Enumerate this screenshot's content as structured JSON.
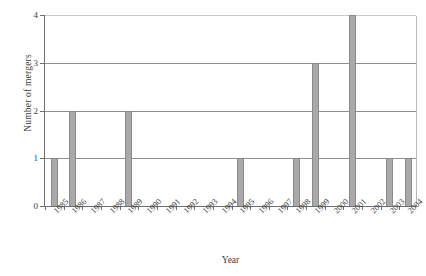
{
  "chart_data": {
    "type": "bar",
    "title": "",
    "xlabel": "Year",
    "ylabel": "Number of mergers",
    "categories": [
      "1985",
      "1986",
      "1987",
      "1988",
      "1989",
      "1990",
      "1991",
      "1992",
      "1993",
      "1994",
      "1995",
      "1996",
      "1997",
      "1998",
      "1999",
      "2000",
      "2001",
      "2002",
      "2003",
      "2004"
    ],
    "values": [
      1,
      2,
      0,
      0,
      2,
      0,
      0,
      0,
      0,
      0,
      1,
      0,
      0,
      1,
      3,
      0,
      4,
      0,
      1,
      1
    ],
    "ylim": [
      0,
      4
    ],
    "yticks": [
      "0",
      "1",
      "2",
      "3",
      "4"
    ],
    "grid": true,
    "legend": "none",
    "bar_color": "#a9a9a9",
    "bar_edge_color": "#8a8a8a",
    "axis_color": "#6f6f6f",
    "grid_color": "#8e8e8e"
  }
}
